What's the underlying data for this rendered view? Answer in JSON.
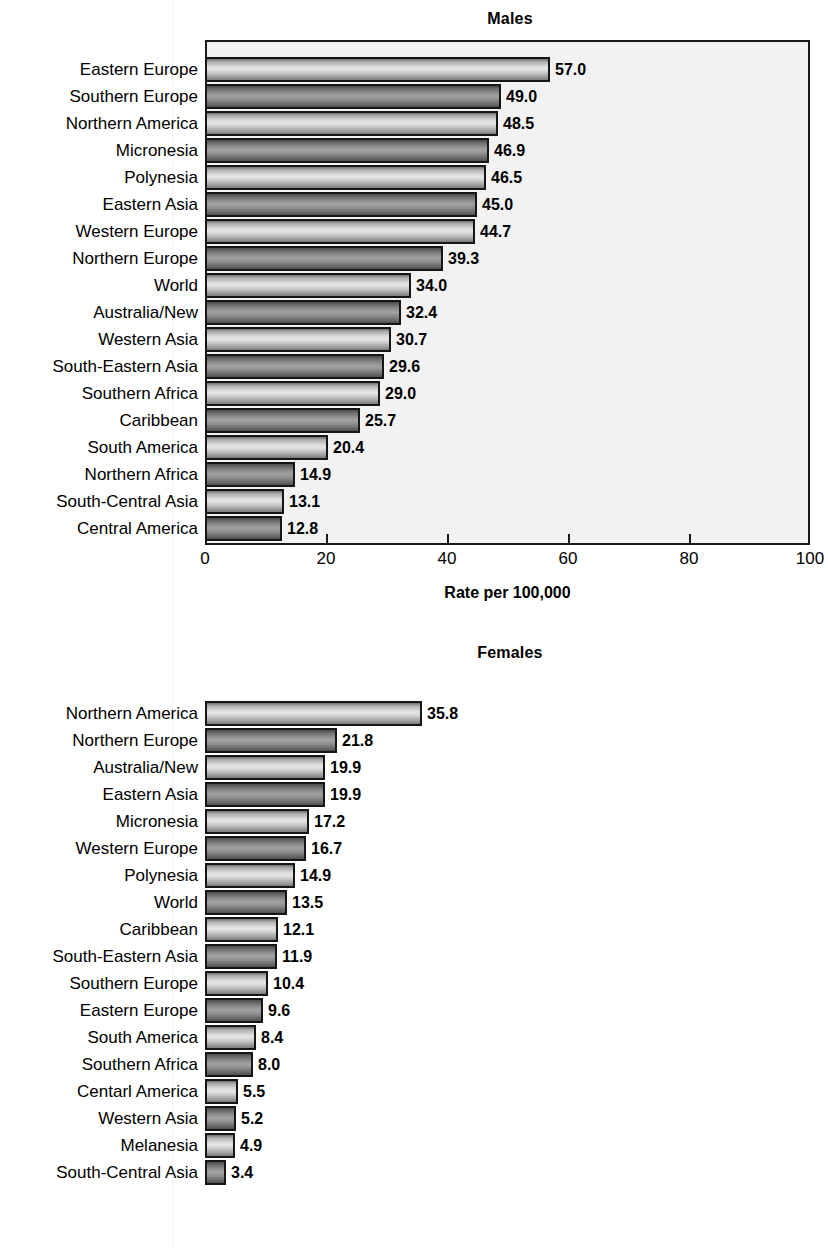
{
  "axis": {
    "title": "Rate per 100,000",
    "ticks": [
      0,
      20,
      40,
      60,
      80,
      100
    ],
    "min": 0,
    "max": 100
  },
  "charts": [
    {
      "id": "males",
      "title": "Males"
    },
    {
      "id": "females",
      "title": "Females"
    }
  ],
  "chart_data": [
    {
      "type": "bar",
      "orientation": "horizontal",
      "title": "Males",
      "xlabel": "Rate per 100,000",
      "ylabel": "",
      "xlim": [
        0,
        100
      ],
      "xticks": [
        0,
        20,
        40,
        60,
        80,
        100
      ],
      "grid": false,
      "legend": "none",
      "categories": [
        "Eastern Europe",
        "Southern Europe",
        "Northern America",
        "Micronesia",
        "Polynesia",
        "Eastern Asia",
        "Western Europe",
        "Northern Europe",
        "World",
        "Australia/New",
        "Western Asia",
        "South-Eastern Asia",
        "Southern Africa",
        "Caribbean",
        "South America",
        "Northern Africa",
        "South-Central Asia",
        "Central America"
      ],
      "values": [
        57.0,
        49.0,
        48.5,
        46.9,
        46.5,
        45.0,
        44.7,
        39.3,
        34.0,
        32.4,
        30.7,
        29.6,
        29.0,
        25.7,
        20.4,
        14.9,
        13.1,
        12.8
      ],
      "labels": [
        "57.0",
        "49.0",
        "48.5",
        "46.9",
        "46.5",
        "45.0",
        "44.7",
        "39.3",
        "34.0",
        "32.4",
        "30.7",
        "29.6",
        "29.0",
        "25.7",
        "20.4",
        "14.9",
        "13.1",
        "12.8"
      ]
    },
    {
      "type": "bar",
      "orientation": "horizontal",
      "title": "Females",
      "xlabel": "Rate per 100,000",
      "ylabel": "",
      "xlim": [
        0,
        100
      ],
      "xticks": [
        0,
        20,
        40,
        60,
        80,
        100
      ],
      "grid": false,
      "legend": "none",
      "categories": [
        "Northern America",
        "Northern Europe",
        "Australia/New",
        "Eastern Asia",
        "Micronesia",
        "Western Europe",
        "Polynesia",
        "World",
        "Caribbean",
        "South-Eastern Asia",
        "Southern Europe",
        "Eastern Europe",
        "South America",
        "Southern Africa",
        "Centarl America",
        "Western Asia",
        "Melanesia",
        "South-Central Asia"
      ],
      "values": [
        35.8,
        21.8,
        19.9,
        19.9,
        17.2,
        16.7,
        14.9,
        13.5,
        12.1,
        11.9,
        10.4,
        9.6,
        8.4,
        8.0,
        5.5,
        5.2,
        4.9,
        3.4
      ],
      "labels": [
        "35.8",
        "21.8",
        "19.9",
        "19.9",
        "17.2",
        "16.7",
        "14.9",
        "13.5",
        "12.1",
        "11.9",
        "10.4",
        "9.6",
        "8.4",
        "8.0",
        "5.5",
        "5.2",
        "4.9",
        "3.4"
      ]
    }
  ]
}
